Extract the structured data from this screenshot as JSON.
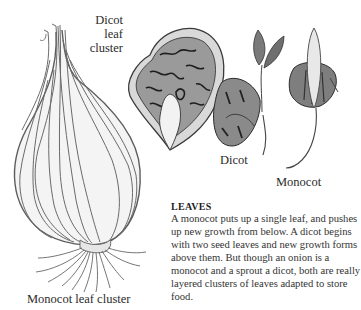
{
  "labels": {
    "dicot_leaf_cluster": [
      "Dicot leaf",
      "cluster"
    ],
    "dicot": "Dicot",
    "monocot": "Monocot",
    "monocot_leaf_cluster": "Monocot leaf cluster"
  },
  "caption": {
    "title": "LEAVES",
    "body": "A monocot puts up a single leaf, and pushes up new growth from below. A dicot begins with two seed leaves and new growth forms above them. But though an onion is a monocot and a sprout a dicot, both are really layered clusters of leaves adapted to store food."
  },
  "illustrations": [
    {
      "name": "onion-bulb",
      "depicts": "Monocot leaf cluster"
    },
    {
      "name": "cabbage-cross-section",
      "depicts": "Dicot leaf cluster"
    },
    {
      "name": "dicot-sprout",
      "depicts": "Dicot"
    },
    {
      "name": "monocot-sprout",
      "depicts": "Monocot"
    }
  ]
}
